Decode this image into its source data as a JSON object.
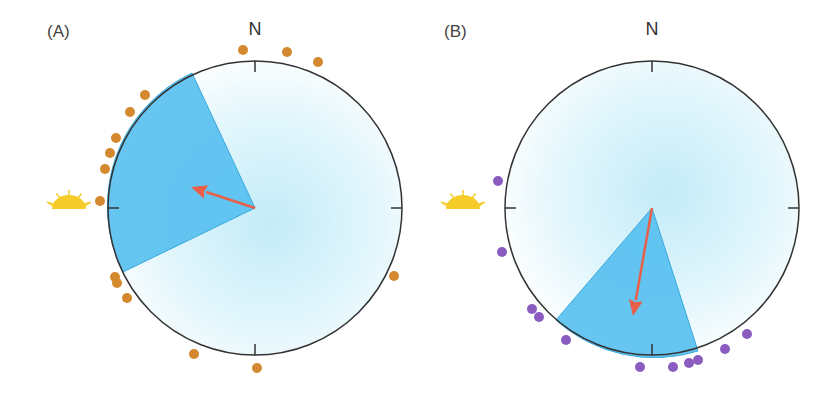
{
  "panels": [
    {
      "label": "(A)",
      "north_label": "N",
      "center": [
        255,
        208
      ],
      "radius": 147,
      "wedge": {
        "p1": [
          192,
          73
        ],
        "p2": [
          123,
          272
        ],
        "color": "#55bfef"
      },
      "arrow": {
        "from": [
          255,
          208
        ],
        "to": [
          191,
          187
        ],
        "color": "#e8604a"
      },
      "sun_position": [
        69,
        203
      ],
      "dot_color": "#d4892f",
      "dots": [
        [
          243,
          50
        ],
        [
          287,
          52
        ],
        [
          318,
          62
        ],
        [
          145,
          95
        ],
        [
          130,
          112
        ],
        [
          116,
          138
        ],
        [
          110,
          153
        ],
        [
          105,
          169
        ],
        [
          100,
          201
        ],
        [
          115,
          277
        ],
        [
          117,
          283
        ],
        [
          127,
          298
        ],
        [
          194,
          354
        ],
        [
          257,
          368
        ],
        [
          394,
          276
        ]
      ]
    },
    {
      "label": "(B)",
      "north_label": "N",
      "center": [
        652,
        208
      ],
      "radius": 147,
      "wedge": {
        "p1": [
          556,
          320
        ],
        "p2": [
          698,
          351
        ],
        "color": "#55bfef"
      },
      "arrow": {
        "from": [
          652,
          208
        ],
        "to": [
          633,
          316
        ],
        "color": "#e8604a"
      },
      "sun_position": [
        463,
        203
      ],
      "dot_color": "#8a5cc0",
      "dots": [
        [
          498,
          181
        ],
        [
          502,
          252
        ],
        [
          532,
          309
        ],
        [
          539,
          317
        ],
        [
          566,
          340
        ],
        [
          640,
          367
        ],
        [
          673,
          367
        ],
        [
          689,
          363
        ],
        [
          698,
          360
        ],
        [
          725,
          349
        ],
        [
          747,
          334
        ]
      ]
    }
  ],
  "colors": {
    "circle_stroke": "#333333",
    "center_glow": "#bfe9f7",
    "sun": "#f5cc2a"
  }
}
